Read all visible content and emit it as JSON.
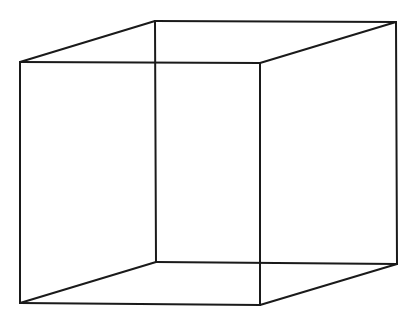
{
  "figure": {
    "type": "necker-cube-wireframe",
    "background": "#ffffff",
    "stroke_color": "#1a1a1a",
    "vertices": {
      "front_top_left": [
        20,
        62
      ],
      "front_top_right": [
        260,
        63
      ],
      "front_bottom_left": [
        20,
        303
      ],
      "front_bottom_right": [
        260,
        305
      ],
      "back_top_left": [
        155,
        21
      ],
      "back_top_right": [
        396,
        22
      ],
      "back_bottom_left": [
        156,
        262
      ],
      "back_bottom_right": [
        397,
        264
      ]
    },
    "edges": [
      [
        "front_top_left",
        "front_top_right"
      ],
      [
        "front_top_right",
        "front_bottom_right"
      ],
      [
        "front_bottom_right",
        "front_bottom_left"
      ],
      [
        "front_bottom_left",
        "front_top_left"
      ],
      [
        "back_top_left",
        "back_top_right"
      ],
      [
        "back_top_right",
        "back_bottom_right"
      ],
      [
        "back_bottom_right",
        "back_bottom_left"
      ],
      [
        "back_bottom_left",
        "back_top_left"
      ],
      [
        "front_top_left",
        "back_top_left"
      ],
      [
        "front_top_right",
        "back_top_right"
      ],
      [
        "front_bottom_left",
        "back_bottom_left"
      ],
      [
        "front_bottom_right",
        "back_bottom_right"
      ]
    ]
  }
}
